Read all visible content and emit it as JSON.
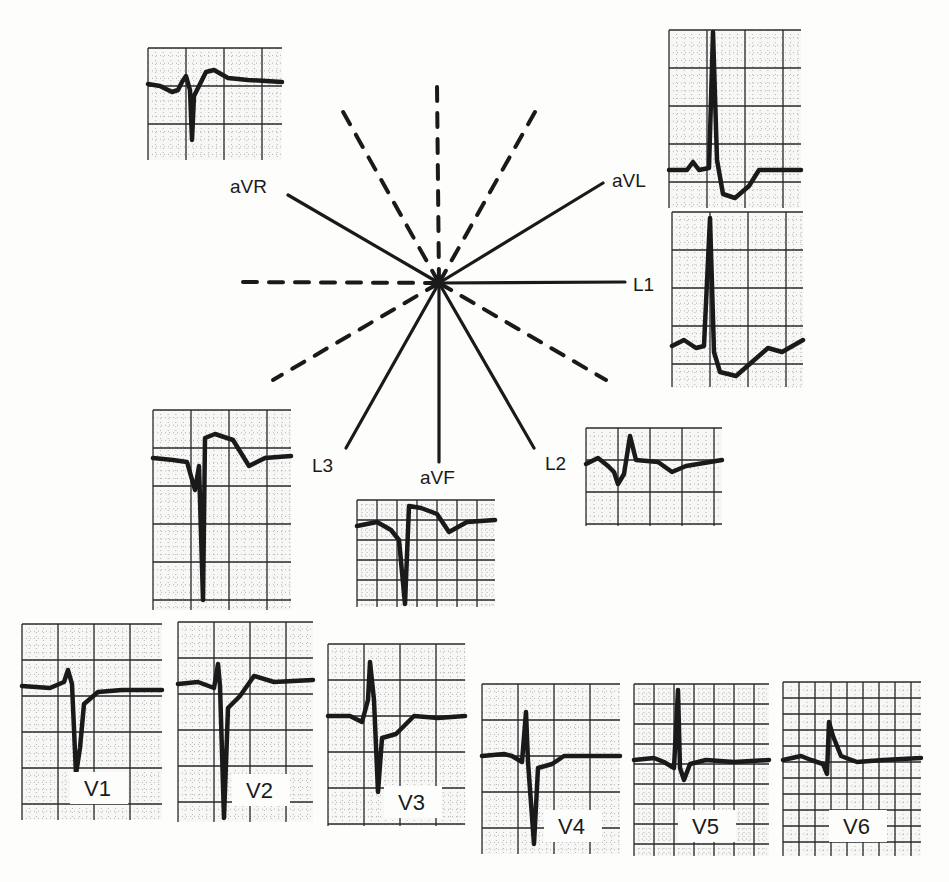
{
  "diagram": {
    "title": "",
    "center": {
      "x": 439,
      "y": 283
    },
    "colors": {
      "ink": "#1a1a1a",
      "grid_major": "#2a2a2a",
      "grid_minor": "#8a8a8a",
      "paper": "#f7f7f5"
    },
    "axes_solid": [
      {
        "name": "L1",
        "x2": 625,
        "y2": 282,
        "label": "L1",
        "lx": 633,
        "ly": 291
      },
      {
        "name": "aVL",
        "x2": 603,
        "y2": 183,
        "label": "aVL",
        "lx": 612,
        "ly": 187
      },
      {
        "name": "aVR",
        "x2": 288,
        "y2": 195,
        "label": "aVR",
        "lx": 230,
        "ly": 193
      },
      {
        "name": "L2",
        "x2": 534,
        "y2": 448,
        "label": "L2",
        "lx": 545,
        "ly": 470
      },
      {
        "name": "aVF",
        "x2": 439,
        "y2": 462,
        "label": "aVF",
        "lx": 420,
        "ly": 484
      },
      {
        "name": "L3",
        "x2": 346,
        "y2": 448,
        "label": "L3",
        "lx": 312,
        "ly": 472
      }
    ],
    "axes_dashed": [
      {
        "x2": 240,
        "y2": 282
      },
      {
        "x2": 437,
        "y2": 85
      },
      {
        "x2": 342,
        "y2": 110
      },
      {
        "x2": 535,
        "y2": 112
      },
      {
        "x2": 273,
        "y2": 380
      },
      {
        "x2": 606,
        "y2": 380
      }
    ],
    "strips": [
      {
        "id": "aVR",
        "label": "",
        "x": 148,
        "y": 48,
        "w": 134,
        "h": 112,
        "major": 38,
        "minor": 7.6,
        "baseline": 40,
        "wave": "M0,36 L12,38 L24,44 L30,42 L34,34 L38,28 L42,42 L44,92 L46,48 L52,36 L58,24 L66,22 L80,30 L100,32 L134,34"
      },
      {
        "id": "aVL",
        "label": "",
        "x": 669,
        "y": 30,
        "w": 132,
        "h": 178,
        "major": 38,
        "minor": 7.6,
        "baseline": 140,
        "wave": "M0,140 L18,140 L24,132 L30,140 L40,138 L44,2 L48,130 L54,164 L66,168 L80,156 L90,140 L132,140"
      },
      {
        "id": "L1",
        "label": "",
        "x": 672,
        "y": 212,
        "w": 131,
        "h": 175,
        "major": 38,
        "minor": 7.6,
        "baseline": 130,
        "wave": "M0,134 L12,128 L24,136 L32,134 L38,6 L42,140 L48,160 L64,164 L80,150 L96,136 L110,140 L131,128"
      },
      {
        "id": "L3",
        "label": "",
        "x": 153,
        "y": 410,
        "w": 138,
        "h": 200,
        "major": 38,
        "minor": 7.6,
        "baseline": 48,
        "wave": "M0,48 L20,50 L34,52 L42,80 L46,56 L50,190 L52,28 L62,24 L80,30 L96,56 L112,48 L138,46"
      },
      {
        "id": "aVF",
        "label": "",
        "x": 357,
        "y": 500,
        "w": 138,
        "h": 107,
        "major": 20,
        "minor": 5,
        "baseline": 24,
        "wave": "M0,26 L20,22 L34,30 L42,40 L48,104 L52,6 L64,8 L80,14 L92,32 L110,22 L138,20"
      },
      {
        "id": "L2",
        "label": "",
        "x": 586,
        "y": 428,
        "w": 136,
        "h": 98,
        "major": 32,
        "minor": 8,
        "baseline": 34,
        "wave": "M0,36 L12,30 L22,38 L28,44 L32,56 L38,46 L44,8 L50,32 L72,34 L86,44 L100,38 L136,32"
      },
      {
        "id": "V1",
        "label": "V1",
        "x": 22,
        "y": 624,
        "w": 140,
        "h": 196,
        "major": 36,
        "minor": 7.2,
        "baseline": 60,
        "wave": "M0,62 L28,64 L42,58 L46,46 L50,60 L54,150 L58,124 L62,80 L76,68 L100,66 L140,66",
        "lx": 62,
        "ly": 172
      },
      {
        "id": "V2",
        "label": "V2",
        "x": 178,
        "y": 622,
        "w": 135,
        "h": 200,
        "major": 36,
        "minor": 7.2,
        "baseline": 60,
        "wave": "M0,62 L20,60 L36,66 L40,42 L42,64 L46,196 L50,86 L62,74 L76,54 L96,60 L135,58",
        "lx": 68,
        "ly": 176
      },
      {
        "id": "V3",
        "label": "V3",
        "x": 328,
        "y": 644,
        "w": 137,
        "h": 182,
        "major": 36,
        "minor": 7.2,
        "baseline": 72,
        "wave": "M0,72 L22,72 L34,78 L40,56 L42,18 L46,56 L50,148 L54,94 L68,90 L86,72 L110,74 L137,72",
        "lx": 70,
        "ly": 166
      },
      {
        "id": "V4",
        "label": "V4",
        "x": 482,
        "y": 684,
        "w": 138,
        "h": 170,
        "major": 36,
        "minor": 7.2,
        "baseline": 74,
        "wave": "M0,72 L22,70 L30,72 L40,78 L44,28 L46,78 L52,160 L56,84 L70,80 L82,72 L138,72",
        "lx": 76,
        "ly": 150
      },
      {
        "id": "V5",
        "label": "V5",
        "x": 634,
        "y": 684,
        "w": 135,
        "h": 172,
        "major": 20,
        "minor": 5,
        "baseline": 76,
        "wave": "M0,76 L20,74 L30,78 L40,84 L44,6 L46,84 L50,96 L56,80 L72,76 L100,78 L135,76",
        "lx": 58,
        "ly": 150
      },
      {
        "id": "V6",
        "label": "V6",
        "x": 783,
        "y": 682,
        "w": 138,
        "h": 174,
        "major": 16,
        "minor": 8,
        "baseline": 78,
        "wave": "M0,78 L18,74 L28,78 L40,82 L44,92 L46,40 L50,54 L58,74 L74,80 L100,78 L138,76",
        "lx": 60,
        "ly": 152
      }
    ],
    "labels": [
      "aVR",
      "aVL",
      "L1",
      "L2",
      "aVF",
      "L3",
      "V1",
      "V2",
      "V3",
      "V4",
      "V5",
      "V6"
    ]
  }
}
